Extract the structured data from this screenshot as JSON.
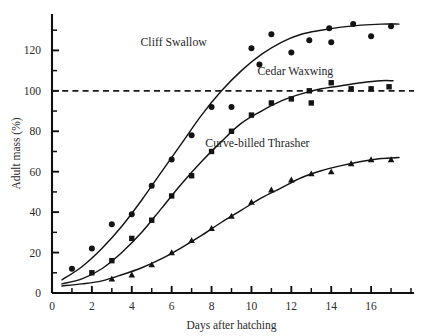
{
  "chart_data": {
    "type": "scatter",
    "title": "",
    "xlabel": "Days after hatching",
    "ylabel": "Adult mass (%)",
    "xlim": [
      0,
      18
    ],
    "ylim": [
      0,
      138
    ],
    "xticks": [
      0,
      2,
      4,
      6,
      8,
      10,
      12,
      14,
      16
    ],
    "xtick_labels": [
      "0",
      "2",
      "4",
      "6",
      "8",
      "10",
      "12",
      "14",
      "16"
    ],
    "x_minor_step": 1,
    "yticks": [
      0,
      20,
      40,
      60,
      80,
      100,
      120
    ],
    "ytick_labels": [
      "0",
      "20",
      "40",
      "60",
      "80",
      "100",
      "120"
    ],
    "y_minor_step": 10,
    "grid": false,
    "legend_position": "inline-annotations",
    "reference_lines": [
      {
        "axis": "y",
        "value": 100,
        "style": "dashed",
        "label": "100% adult mass"
      }
    ],
    "series": [
      {
        "name": "Cliff Swallow",
        "marker": "circle",
        "label_x": 6.1,
        "label_y": 122,
        "asymptote": 133,
        "points": [
          {
            "x": 1,
            "y": 12
          },
          {
            "x": 2,
            "y": 22
          },
          {
            "x": 3,
            "y": 34
          },
          {
            "x": 4,
            "y": 39
          },
          {
            "x": 5,
            "y": 53
          },
          {
            "x": 6,
            "y": 66
          },
          {
            "x": 7,
            "y": 78
          },
          {
            "x": 8,
            "y": 92
          },
          {
            "x": 9,
            "y": 92
          },
          {
            "x": 10,
            "y": 121
          },
          {
            "x": 10.4,
            "y": 113
          },
          {
            "x": 11,
            "y": 128
          },
          {
            "x": 12,
            "y": 119
          },
          {
            "x": 12.9,
            "y": 125
          },
          {
            "x": 13.9,
            "y": 131
          },
          {
            "x": 14,
            "y": 124
          },
          {
            "x": 15.1,
            "y": 133
          },
          {
            "x": 16,
            "y": 127
          },
          {
            "x": 17,
            "y": 132
          }
        ],
        "fit": [
          {
            "x": 0.5,
            "y": 6.5
          },
          {
            "x": 1.5,
            "y": 13
          },
          {
            "x": 2.5,
            "y": 22
          },
          {
            "x": 3.5,
            "y": 33
          },
          {
            "x": 4.5,
            "y": 46
          },
          {
            "x": 5.5,
            "y": 60
          },
          {
            "x": 6.5,
            "y": 74
          },
          {
            "x": 7.5,
            "y": 88
          },
          {
            "x": 8.5,
            "y": 100
          },
          {
            "x": 9.5,
            "y": 110
          },
          {
            "x": 10.5,
            "y": 118
          },
          {
            "x": 11.5,
            "y": 124
          },
          {
            "x": 12.5,
            "y": 128
          },
          {
            "x": 13.5,
            "y": 130
          },
          {
            "x": 14.5,
            "y": 131.5
          },
          {
            "x": 15.5,
            "y": 132.5
          },
          {
            "x": 16.5,
            "y": 133
          },
          {
            "x": 17.4,
            "y": 133
          }
        ]
      },
      {
        "name": "Cedar Waxwing",
        "marker": "square",
        "label_x": 12.2,
        "label_y": 108,
        "asymptote": 105,
        "points": [
          {
            "x": 2,
            "y": 10
          },
          {
            "x": 3,
            "y": 16
          },
          {
            "x": 4,
            "y": 27
          },
          {
            "x": 5,
            "y": 36
          },
          {
            "x": 6,
            "y": 48
          },
          {
            "x": 7,
            "y": 58
          },
          {
            "x": 8,
            "y": 70
          },
          {
            "x": 9,
            "y": 80
          },
          {
            "x": 10,
            "y": 88
          },
          {
            "x": 11,
            "y": 94
          },
          {
            "x": 12,
            "y": 96
          },
          {
            "x": 12.9,
            "y": 100
          },
          {
            "x": 13,
            "y": 94
          },
          {
            "x": 14,
            "y": 104
          },
          {
            "x": 15,
            "y": 101
          },
          {
            "x": 16,
            "y": 101
          },
          {
            "x": 16.9,
            "y": 102
          }
        ],
        "fit": [
          {
            "x": 0.5,
            "y": 4.5
          },
          {
            "x": 1.5,
            "y": 7
          },
          {
            "x": 2.5,
            "y": 12
          },
          {
            "x": 3.5,
            "y": 20
          },
          {
            "x": 4.5,
            "y": 30
          },
          {
            "x": 5.5,
            "y": 42
          },
          {
            "x": 6.5,
            "y": 54
          },
          {
            "x": 7.5,
            "y": 65
          },
          {
            "x": 8.5,
            "y": 75
          },
          {
            "x": 9.5,
            "y": 84
          },
          {
            "x": 10.5,
            "y": 90
          },
          {
            "x": 11.5,
            "y": 95
          },
          {
            "x": 12.5,
            "y": 98.5
          },
          {
            "x": 13.5,
            "y": 101
          },
          {
            "x": 14.5,
            "y": 102.5
          },
          {
            "x": 15.5,
            "y": 104
          },
          {
            "x": 16.5,
            "y": 105
          },
          {
            "x": 17.1,
            "y": 105
          }
        ]
      },
      {
        "name": "Curve-billed Thrasher",
        "marker": "triangle",
        "label_x": 10.3,
        "label_y": 72,
        "asymptote": 67,
        "points": [
          {
            "x": 3,
            "y": 7
          },
          {
            "x": 4,
            "y": 9
          },
          {
            "x": 5,
            "y": 14
          },
          {
            "x": 6,
            "y": 20
          },
          {
            "x": 7,
            "y": 26
          },
          {
            "x": 8,
            "y": 32
          },
          {
            "x": 9,
            "y": 38
          },
          {
            "x": 10,
            "y": 45
          },
          {
            "x": 11,
            "y": 51
          },
          {
            "x": 12,
            "y": 56
          },
          {
            "x": 13,
            "y": 59
          },
          {
            "x": 14,
            "y": 60
          },
          {
            "x": 15,
            "y": 64
          },
          {
            "x": 16,
            "y": 66
          },
          {
            "x": 17,
            "y": 66
          }
        ],
        "fit": [
          {
            "x": 0.5,
            "y": 3.5
          },
          {
            "x": 1.5,
            "y": 4.5
          },
          {
            "x": 2.5,
            "y": 6
          },
          {
            "x": 3.5,
            "y": 9
          },
          {
            "x": 4.5,
            "y": 12.5
          },
          {
            "x": 5.5,
            "y": 17
          },
          {
            "x": 6.5,
            "y": 22.5
          },
          {
            "x": 7.5,
            "y": 28.5
          },
          {
            "x": 8.5,
            "y": 35
          },
          {
            "x": 9.5,
            "y": 41
          },
          {
            "x": 10.5,
            "y": 47
          },
          {
            "x": 11.5,
            "y": 52
          },
          {
            "x": 12.5,
            "y": 57
          },
          {
            "x": 13.5,
            "y": 60.5
          },
          {
            "x": 14.5,
            "y": 63
          },
          {
            "x": 15.5,
            "y": 65
          },
          {
            "x": 16.5,
            "y": 66.5
          },
          {
            "x": 17.4,
            "y": 67
          }
        ]
      }
    ]
  }
}
